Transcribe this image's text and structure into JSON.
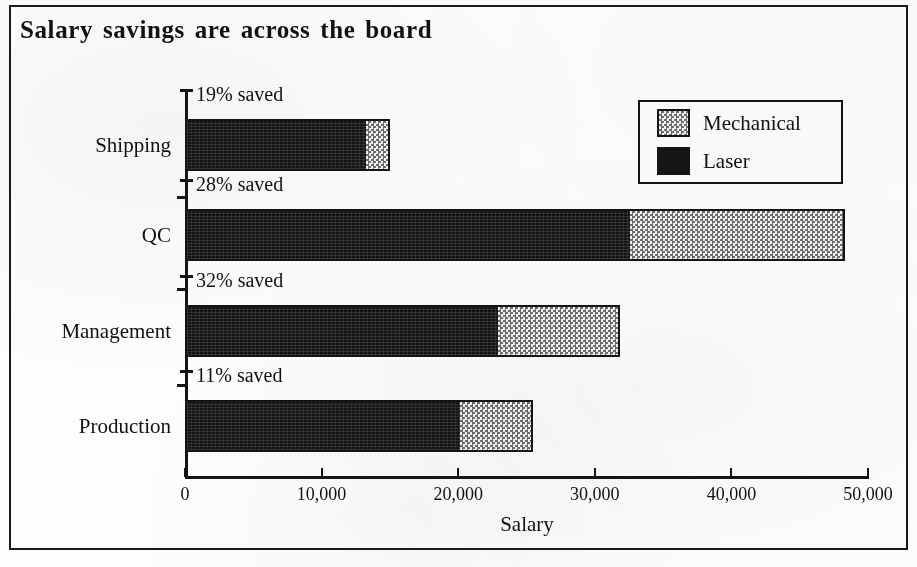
{
  "figure": {
    "title": "Salary savings are across the board"
  },
  "chart_data": {
    "type": "bar",
    "orientation": "horizontal",
    "stacked": true,
    "title": "Salary savings are across the board",
    "xlabel": "Salary",
    "ylabel": "",
    "xlim": [
      0,
      50000
    ],
    "xticks": [
      0,
      10000,
      20000,
      30000,
      40000,
      50000
    ],
    "xticklabels": [
      "0",
      "10,000",
      "20,000",
      "30,000",
      "40,000",
      "50,000"
    ],
    "grid": false,
    "legend_position": "upper-right",
    "categories": [
      "Shipping",
      "QC",
      "Management",
      "Production"
    ],
    "series": [
      {
        "name": "Laser",
        "color": "#151515",
        "values": [
          13100,
          32400,
          22800,
          20000
        ]
      },
      {
        "name": "Mechanical",
        "color": "#f3f3f1",
        "values": [
          1900,
          15900,
          9050,
          5500
        ]
      }
    ],
    "totals": [
      15000,
      48300,
      31850,
      25500
    ],
    "annotations": [
      {
        "category": "Shipping",
        "text": "19% saved"
      },
      {
        "category": "QC",
        "text": "28% saved"
      },
      {
        "category": "Management",
        "text": "32% saved"
      },
      {
        "category": "Production",
        "text": "11% saved"
      }
    ]
  },
  "legend": {
    "entries": [
      {
        "label": "Mechanical",
        "swatch": "stipple-pattern"
      },
      {
        "label": "Laser",
        "swatch": "solid-black"
      }
    ]
  },
  "axis": {
    "x_title": "Salary",
    "tick_labels": [
      "0",
      "10,000",
      "20,000",
      "30,000",
      "40,000",
      "50,000"
    ],
    "category_labels": [
      "Shipping",
      "QC",
      "Management",
      "Production"
    ]
  },
  "annotations": {
    "shipping": "19% saved",
    "qc": "28% saved",
    "management": "32% saved",
    "production": "11% saved"
  }
}
